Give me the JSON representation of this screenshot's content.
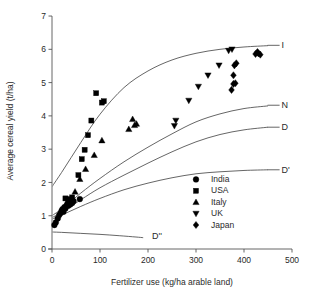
{
  "chart_data": {
    "type": "scatter",
    "title": "",
    "xlabel": "Fertilizer use (kg/ha arable land)",
    "ylabel": "Average cereal yield (t/ha)",
    "xlim": [
      0,
      500
    ],
    "ylim": [
      0,
      7
    ],
    "xticks": [
      0,
      100,
      200,
      300,
      400,
      500
    ],
    "yticks": [
      0,
      1,
      2,
      3,
      4,
      5,
      6,
      7
    ],
    "xtick_labels": [
      "0",
      "100",
      "200",
      "300",
      "400",
      "500"
    ],
    "ytick_labels": [
      "0",
      "1",
      "2",
      "3",
      "4",
      "5",
      "6",
      "7"
    ],
    "grid": false,
    "legend_position": "lower-right",
    "series": [
      {
        "name": "India",
        "marker": "circle",
        "color": "#000000",
        "points": [
          [
            5,
            0.72
          ],
          [
            8,
            0.8
          ],
          [
            12,
            0.92
          ],
          [
            15,
            1.02
          ],
          [
            18,
            1.08
          ],
          [
            20,
            1.15
          ],
          [
            22,
            1.2
          ],
          [
            24,
            1.12
          ],
          [
            26,
            1.26
          ],
          [
            28,
            1.22
          ],
          [
            30,
            1.3
          ],
          [
            32,
            1.36
          ],
          [
            34,
            1.3
          ],
          [
            36,
            1.4
          ],
          [
            38,
            1.34
          ],
          [
            40,
            1.42
          ],
          [
            42,
            1.38
          ],
          [
            45,
            1.44
          ],
          [
            58,
            1.5
          ]
        ]
      },
      {
        "name": "USA",
        "marker": "square",
        "color": "#000000",
        "points": [
          [
            28,
            1.52
          ],
          [
            34,
            1.45
          ],
          [
            38,
            1.5
          ],
          [
            42,
            1.55
          ],
          [
            55,
            2.22
          ],
          [
            62,
            2.7
          ],
          [
            68,
            2.98
          ],
          [
            75,
            3.42
          ],
          [
            82,
            3.86
          ],
          [
            92,
            4.68
          ],
          [
            104,
            4.4
          ],
          [
            108,
            4.44
          ]
        ]
      },
      {
        "name": "Italy",
        "marker": "triangle-up",
        "color": "#000000",
        "points": [
          [
            35,
            1.38
          ],
          [
            48,
            1.72
          ],
          [
            58,
            2.1
          ],
          [
            70,
            2.4
          ],
          [
            88,
            2.82
          ],
          [
            104,
            3.26
          ],
          [
            160,
            3.6
          ],
          [
            168,
            3.9
          ],
          [
            172,
            3.72
          ],
          [
            176,
            3.76
          ]
        ]
      },
      {
        "name": "UK",
        "marker": "triangle-down",
        "color": "#000000",
        "points": [
          [
            255,
            3.7
          ],
          [
            258,
            3.86
          ],
          [
            285,
            4.46
          ],
          [
            305,
            4.88
          ],
          [
            325,
            5.22
          ],
          [
            348,
            5.52
          ],
          [
            368,
            5.96
          ],
          [
            375,
            6.0
          ]
        ]
      },
      {
        "name": "Japan",
        "marker": "diamond",
        "color": "#000000",
        "points": [
          [
            374,
            4.78
          ],
          [
            378,
            4.96
          ],
          [
            382,
            4.98
          ],
          [
            378,
            5.22
          ],
          [
            380,
            5.52
          ],
          [
            384,
            5.58
          ],
          [
            424,
            5.86
          ],
          [
            430,
            5.88
          ],
          [
            434,
            5.84
          ],
          [
            428,
            5.92
          ]
        ]
      }
    ],
    "curves": [
      {
        "name": "I",
        "label": "I",
        "label_x": 470,
        "label_y": 6.12,
        "points": [
          [
            -20,
            1.45
          ],
          [
            20,
            2.3
          ],
          [
            60,
            3.2
          ],
          [
            100,
            4.05
          ],
          [
            150,
            4.85
          ],
          [
            200,
            5.35
          ],
          [
            250,
            5.68
          ],
          [
            300,
            5.88
          ],
          [
            350,
            6.0
          ],
          [
            400,
            6.07
          ],
          [
            450,
            6.11
          ]
        ]
      },
      {
        "name": "N",
        "label": "N",
        "label_x": 470,
        "label_y": 4.32,
        "points": [
          [
            -20,
            0.82
          ],
          [
            20,
            1.2
          ],
          [
            60,
            1.68
          ],
          [
            100,
            2.12
          ],
          [
            150,
            2.62
          ],
          [
            200,
            3.06
          ],
          [
            250,
            3.46
          ],
          [
            300,
            3.82
          ],
          [
            350,
            4.06
          ],
          [
            400,
            4.22
          ],
          [
            450,
            4.3
          ]
        ]
      },
      {
        "name": "D",
        "label": "D",
        "label_x": 470,
        "label_y": 3.66,
        "points": [
          [
            -20,
            0.8
          ],
          [
            20,
            1.1
          ],
          [
            60,
            1.48
          ],
          [
            100,
            1.84
          ],
          [
            150,
            2.22
          ],
          [
            200,
            2.58
          ],
          [
            250,
            2.92
          ],
          [
            300,
            3.22
          ],
          [
            350,
            3.44
          ],
          [
            400,
            3.58
          ],
          [
            450,
            3.66
          ]
        ]
      },
      {
        "name": "D'",
        "label": "D'",
        "label_x": 470,
        "label_y": 2.38,
        "points": [
          [
            -20,
            0.78
          ],
          [
            20,
            1.02
          ],
          [
            60,
            1.28
          ],
          [
            100,
            1.52
          ],
          [
            150,
            1.78
          ],
          [
            200,
            1.98
          ],
          [
            250,
            2.14
          ],
          [
            300,
            2.26
          ],
          [
            350,
            2.32
          ],
          [
            400,
            2.36
          ],
          [
            450,
            2.38
          ]
        ]
      },
      {
        "name": "D''",
        "label": "D''",
        "label_x": 200,
        "label_y": 0.4,
        "points": [
          [
            -20,
            0.52
          ],
          [
            20,
            0.5
          ],
          [
            60,
            0.47
          ],
          [
            100,
            0.44
          ],
          [
            140,
            0.4
          ],
          [
            175,
            0.36
          ],
          [
            190,
            0.34
          ]
        ]
      }
    ],
    "legend_entries": [
      {
        "label": "India",
        "marker": "circle"
      },
      {
        "label": "USA",
        "marker": "square"
      },
      {
        "label": "Italy",
        "marker": "triangle-up"
      },
      {
        "label": "UK",
        "marker": "triangle-down"
      },
      {
        "label": "Japan",
        "marker": "diamond"
      }
    ]
  }
}
